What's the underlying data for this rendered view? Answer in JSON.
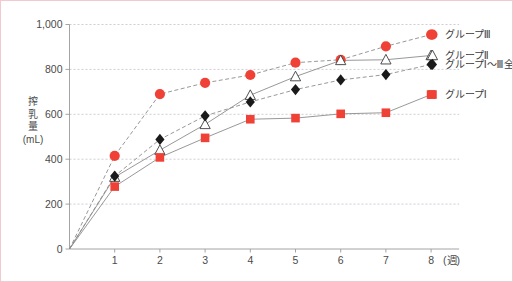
{
  "chart_data": {
    "type": "line",
    "title": "",
    "xlabel": "(週)",
    "ylabel": "搾乳量\n(mL)",
    "ylabel_lines": [
      "搾",
      "乳",
      "量",
      "(mL)"
    ],
    "x": [
      1,
      2,
      3,
      4,
      5,
      6,
      7,
      8
    ],
    "categories": [
      "1",
      "2",
      "3",
      "4",
      "5",
      "6",
      "7",
      "8"
    ],
    "x_tick_labels": [
      "1",
      "2",
      "3",
      "4",
      "5",
      "6",
      "7",
      "8"
    ],
    "x_unit_label": "(週)",
    "y_tick_labels": [
      "0",
      "200",
      "400",
      "600",
      "800",
      "1,000"
    ],
    "y_ticks": [
      0,
      200,
      400,
      600,
      800,
      1000
    ],
    "ylim": [
      0,
      1000
    ],
    "xlim": [
      0,
      8.6
    ],
    "grid": true,
    "grid_axis": "y",
    "legend_position": "right",
    "origin_label": "0",
    "series": [
      {
        "name": "グループⅢ",
        "marker": "circle",
        "marker_color": "#ef4136",
        "line_style": "dashed",
        "line_color": "#8c8c8c",
        "values": [
          415,
          690,
          740,
          775,
          830,
          843,
          903,
          955
        ]
      },
      {
        "name": "グループⅡ",
        "marker": "triangle-open",
        "marker_color": "#ffffff",
        "marker_edge": "#3c3c3c",
        "line_style": "solid",
        "line_color": "#8c8c8c",
        "values": [
          320,
          440,
          555,
          685,
          768,
          840,
          843,
          862
        ]
      },
      {
        "name": "グループⅠ～Ⅲ全体",
        "marker": "diamond",
        "marker_color": "#1a1a1a",
        "line_style": "dashed",
        "line_color": "#8c8c8c",
        "values": [
          325,
          488,
          593,
          655,
          710,
          753,
          777,
          822
        ]
      },
      {
        "name": "グループⅠ",
        "marker": "square",
        "marker_color": "#ef4136",
        "line_style": "solid",
        "line_color": "#8c8c8c",
        "values": [
          278,
          408,
          495,
          578,
          583,
          602,
          607,
          688
        ]
      }
    ],
    "origin_point": 0,
    "colors": {
      "accent_red": "#ef4136",
      "marker_black": "#1a1a1a",
      "line_gray": "#8c8c8c",
      "grid_gray": "#b9b9c6",
      "frame_pink": "#f2c9cf",
      "text_gray": "#4a4a4a",
      "background": "#ffffff"
    }
  },
  "legend": {
    "entries": [
      {
        "label": "グループⅢ",
        "marker": "circle",
        "color": "#ef4136"
      },
      {
        "label": "グループⅡ",
        "marker": "triangle-open",
        "color": "#ffffff"
      },
      {
        "label": "グループⅠ～Ⅲ全体",
        "marker": "diamond",
        "color": "#1a1a1a"
      },
      {
        "label": "グループⅠ",
        "marker": "square",
        "color": "#ef4136"
      }
    ]
  }
}
